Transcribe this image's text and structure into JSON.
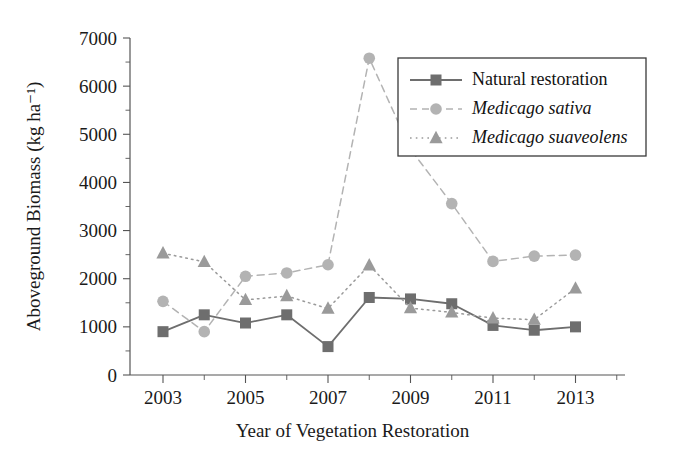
{
  "chart_data": {
    "type": "line",
    "title": "",
    "xlabel": "Year of Vegetation Restoration",
    "ylabel": "Aboveground Biomass (kg ha⁻¹)",
    "x": [
      2003,
      2004,
      2005,
      2006,
      2007,
      2008,
      2009,
      2010,
      2011,
      2012,
      2013
    ],
    "categories": [
      "2003",
      "2004",
      "2005",
      "2006",
      "2007",
      "2008",
      "2009",
      "2010",
      "2011",
      "2012",
      "2013"
    ],
    "xlim": [
      2002.2,
      2014.2
    ],
    "ylim": [
      0,
      7000
    ],
    "xticks_major": [
      "2003",
      "2005",
      "2007",
      "2009",
      "2011",
      "2013"
    ],
    "xticks_major_values": [
      2003,
      2005,
      2007,
      2009,
      2011,
      2013
    ],
    "xticks_minor_values": [
      2004,
      2006,
      2008,
      2010,
      2012,
      2014
    ],
    "yticks": [
      "0",
      "1000",
      "2000",
      "3000",
      "4000",
      "5000",
      "6000",
      "7000"
    ],
    "ytick_values": [
      0,
      1000,
      2000,
      3000,
      4000,
      5000,
      6000,
      7000
    ],
    "yticks_minor_values": [
      500,
      1500,
      2500,
      3500,
      4500,
      5500,
      6500
    ],
    "grid": false,
    "legend_position": "upper right",
    "series": [
      {
        "name": "Natural restoration",
        "italic": false,
        "marker": "square",
        "linestyle": "solid",
        "color": "#6e6e6e",
        "values": [
          900,
          1250,
          1080,
          1250,
          590,
          1610,
          1580,
          1480,
          1030,
          930,
          1000
        ]
      },
      {
        "name": "Medicago sativa",
        "italic": true,
        "marker": "circle",
        "linestyle": "dashed",
        "color": "#b3b3b3",
        "values": [
          1530,
          900,
          2050,
          2120,
          2290,
          6580,
          4690,
          3560,
          2360,
          2470,
          2490
        ]
      },
      {
        "name": "Medicago suaveolens",
        "italic": true,
        "marker": "triangle",
        "linestyle": "dotted",
        "color": "#9a9a9a",
        "values": [
          2530,
          2350,
          1560,
          1640,
          1380,
          2280,
          1390,
          1300,
          1180,
          1150,
          1800
        ]
      }
    ]
  },
  "colors": {
    "axis": "#555555",
    "text": "#1a1a1a",
    "legend_border": "#3a3a3a",
    "background": "#ffffff"
  }
}
